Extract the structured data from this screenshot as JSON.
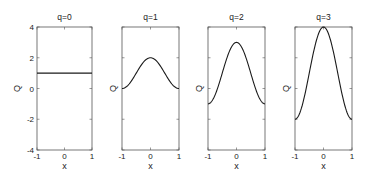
{
  "chart_data": [
    {
      "type": "line",
      "title": "q=0",
      "xlabel": "x",
      "ylabel": "Q",
      "xlim": [
        -1,
        1
      ],
      "ylim": [
        -4,
        4
      ],
      "xticks": [
        "-1",
        "0",
        "1"
      ],
      "yticks": [
        "4",
        "2",
        "0",
        "-2",
        "-4"
      ],
      "show_yticklabels": true,
      "grid": false,
      "x": [
        -1,
        -0.5,
        0,
        0.5,
        1
      ],
      "values": [
        1,
        1,
        1,
        1,
        1
      ],
      "formula_q": 0
    },
    {
      "type": "line",
      "title": "q=1",
      "xlabel": "x",
      "ylabel": "Q",
      "xlim": [
        -1,
        1
      ],
      "ylim": [
        -4,
        4
      ],
      "xticks": [
        "-1",
        "0",
        "1"
      ],
      "show_yticklabels": false,
      "grid": false,
      "x": [
        -1,
        -0.5,
        0,
        0.5,
        1
      ],
      "values": [
        0,
        1,
        2,
        1,
        0
      ],
      "formula_q": 1
    },
    {
      "type": "line",
      "title": "q=2",
      "xlabel": "x",
      "ylabel": "Q",
      "xlim": [
        -1,
        1
      ],
      "ylim": [
        -4,
        4
      ],
      "xticks": [
        "-1",
        "0",
        "1"
      ],
      "show_yticklabels": false,
      "grid": false,
      "x": [
        -1,
        -0.5,
        0,
        0.5,
        1
      ],
      "values": [
        -1,
        1,
        3,
        1,
        -1
      ],
      "formula_q": 2
    },
    {
      "type": "line",
      "title": "q=3",
      "xlabel": "x",
      "ylabel": "Q",
      "xlim": [
        -1,
        1
      ],
      "ylim": [
        -4,
        4
      ],
      "xticks": [
        "-1",
        "0",
        "1"
      ],
      "show_yticklabels": false,
      "grid": false,
      "x": [
        -1,
        -0.5,
        0,
        0.5,
        1
      ],
      "values": [
        -2,
        1,
        4,
        1,
        -2
      ],
      "formula_q": 3
    }
  ],
  "panels": [
    {
      "title": "q=0",
      "xlabel": "x",
      "ylabel": "Q"
    },
    {
      "title": "q=1",
      "xlabel": "x",
      "ylabel": "Q"
    },
    {
      "title": "q=2",
      "xlabel": "x",
      "ylabel": "Q"
    },
    {
      "title": "q=3",
      "xlabel": "x",
      "ylabel": "Q"
    }
  ],
  "style": {
    "line_color": "#1a1a1a",
    "axes_color": "#555555"
  }
}
